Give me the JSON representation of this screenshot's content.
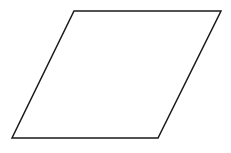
{
  "diagram": {
    "background": "#ffffff",
    "shapes": [
      {
        "type": "parallelogram",
        "name": "parallelogram",
        "stroke": "#1a1a1a",
        "stroke_width": 1.5,
        "fill": "#ffffff",
        "points": [
          [
            74,
            11
          ],
          [
            221,
            11
          ],
          [
            158,
            138
          ],
          [
            12,
            138
          ]
        ]
      }
    ]
  }
}
